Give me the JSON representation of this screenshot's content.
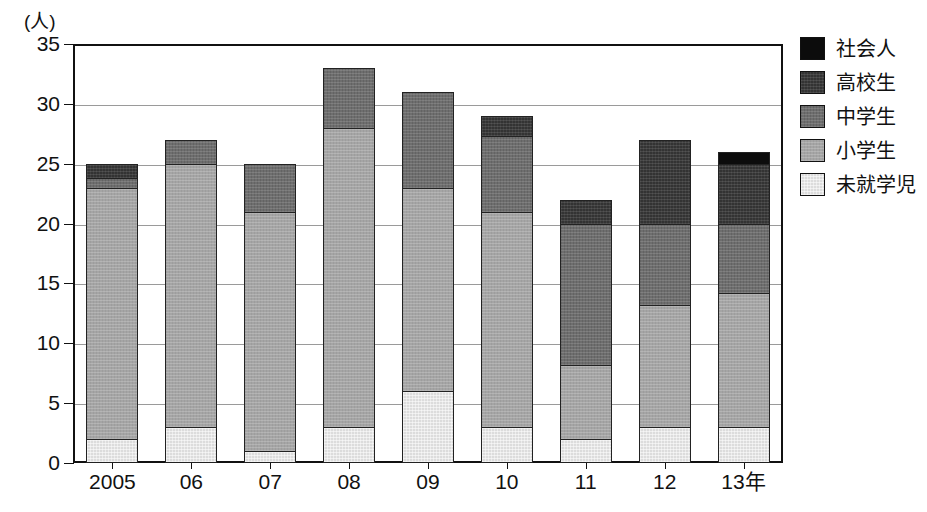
{
  "chart_data": {
    "type": "bar",
    "stacked": true,
    "title": "",
    "xlabel": "",
    "ylabel": "(人)",
    "unit_label": "(人)",
    "axis_suffix": "年",
    "categories": [
      "2005",
      "06",
      "07",
      "08",
      "09",
      "10",
      "11",
      "12",
      "13年"
    ],
    "ylim": [
      0,
      35
    ],
    "yticks": [
      0,
      5,
      10,
      15,
      20,
      25,
      30,
      35
    ],
    "ytick_labels": [
      "0",
      "5",
      "10",
      "15",
      "20",
      "25",
      "30",
      "35"
    ],
    "grid": true,
    "legend_position": "right",
    "series": [
      {
        "name": "未就学児",
        "color": "#dcdcdc",
        "values": [
          2,
          3,
          1,
          3,
          6,
          3,
          2,
          3,
          3
        ]
      },
      {
        "name": "小学生",
        "color": "#a5a5a5",
        "values": [
          21,
          22,
          20,
          25,
          17,
          18,
          6.2,
          10.2,
          11.2
        ]
      },
      {
        "name": "中学生",
        "color": "#6e6e6e",
        "values": [
          0.8,
          2,
          4,
          5,
          8,
          6.3,
          11.8,
          6.8,
          5.8
        ]
      },
      {
        "name": "高校生",
        "color": "#333333",
        "values": [
          1.2,
          0,
          0,
          0,
          0,
          1.7,
          2,
          7,
          5
        ]
      },
      {
        "name": "社会人",
        "color": "#0c0c0c",
        "values": [
          0,
          0,
          0,
          0,
          0,
          0,
          0,
          0,
          1
        ]
      }
    ],
    "totals": [
      25,
      27,
      25,
      33,
      31,
      29,
      22,
      27,
      26
    ]
  },
  "legend": {
    "items": [
      {
        "label": "社会人",
        "color": "#0c0c0c"
      },
      {
        "label": "高校生",
        "color": "#333333"
      },
      {
        "label": "中学生",
        "color": "#6e6e6e"
      },
      {
        "label": "小学生",
        "color": "#a5a5a5"
      },
      {
        "label": "未就学児",
        "color": "#dcdcdc"
      }
    ]
  }
}
